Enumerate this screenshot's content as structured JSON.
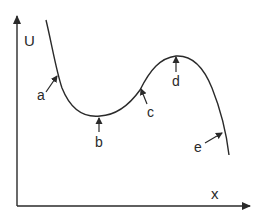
{
  "diagram": {
    "title": "",
    "axes": {
      "y_label": "U",
      "x_label": "x"
    },
    "points": [
      {
        "id": "a",
        "label": "a",
        "description": "steep descending slope"
      },
      {
        "id": "b",
        "label": "b",
        "description": "local minimum"
      },
      {
        "id": "c",
        "label": "c",
        "description": "rising slope"
      },
      {
        "id": "d",
        "label": "d",
        "description": "local maximum"
      },
      {
        "id": "e",
        "label": "e",
        "description": "steep descending slope"
      }
    ],
    "colors": {
      "line": "#2a2a2a",
      "background": "#ffffff"
    }
  }
}
